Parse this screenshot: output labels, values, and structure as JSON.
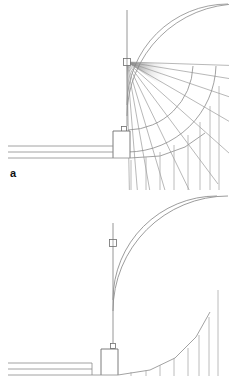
{
  "figure": {
    "background_color": "#ffffff",
    "line_color": "#808080",
    "dark_line_color": "#555555",
    "label_color": "#111111"
  },
  "panels": [
    {
      "id": "a",
      "label": "a",
      "caption": "",
      "has_radiating_fan": true,
      "fan": {
        "origin_x": 127,
        "origin_y": 62,
        "ray_count": 11,
        "start_angle_deg": 2,
        "end_angle_deg": 90,
        "length": 150,
        "shading": "dark-wedge-at-apex"
      },
      "mast": {
        "x": 127,
        "top_y": 10,
        "bottom_y": 62,
        "sensor_box": {
          "x": 127,
          "y": 61,
          "width": 7,
          "height": 6
        }
      },
      "pedestal": {
        "x": 115,
        "y": 131,
        "width": 15,
        "height": 26,
        "cap_box": {
          "x": 123,
          "y": 126,
          "width": 5,
          "height": 5
        }
      },
      "rails": {
        "count": 3,
        "left_x": 8,
        "right_x": 115,
        "y_values": [
          146,
          152,
          158
        ]
      },
      "arcs": {
        "count": 2,
        "center_x": 127,
        "center_y": 4,
        "radii": [
          101,
          112
        ]
      },
      "verticals_below": {
        "count": 8,
        "x_values": [
          131,
          146,
          160,
          174,
          188,
          200,
          210,
          219
        ],
        "bottom_y": 190
      }
    },
    {
      "id": "b",
      "label": "b",
      "caption": "",
      "has_radiating_fan": false,
      "mast": {
        "x": 113,
        "top_y": 33,
        "bottom_y": 158,
        "sensor_box": {
          "x": 113,
          "y": 52,
          "width": 7,
          "height": 6
        }
      },
      "pedestal": {
        "x": 103,
        "y": 158,
        "width": 15,
        "height": 26,
        "cap_box": {
          "x": 111,
          "y": 153,
          "width": 5,
          "height": 5
        }
      },
      "rails": {
        "count": 3,
        "left_x": 8,
        "right_x": 103,
        "y_values": [
          173,
          179,
          185
        ]
      },
      "arcs": {
        "count": 2,
        "center_x": 113,
        "center_y": 6,
        "radii": [
          104,
          115
        ]
      },
      "verticals_below": {
        "count": 8,
        "x_values": [
          131,
          146,
          160,
          174,
          188,
          199,
          209,
          218
        ],
        "bottom_y": 186
      }
    }
  ]
}
